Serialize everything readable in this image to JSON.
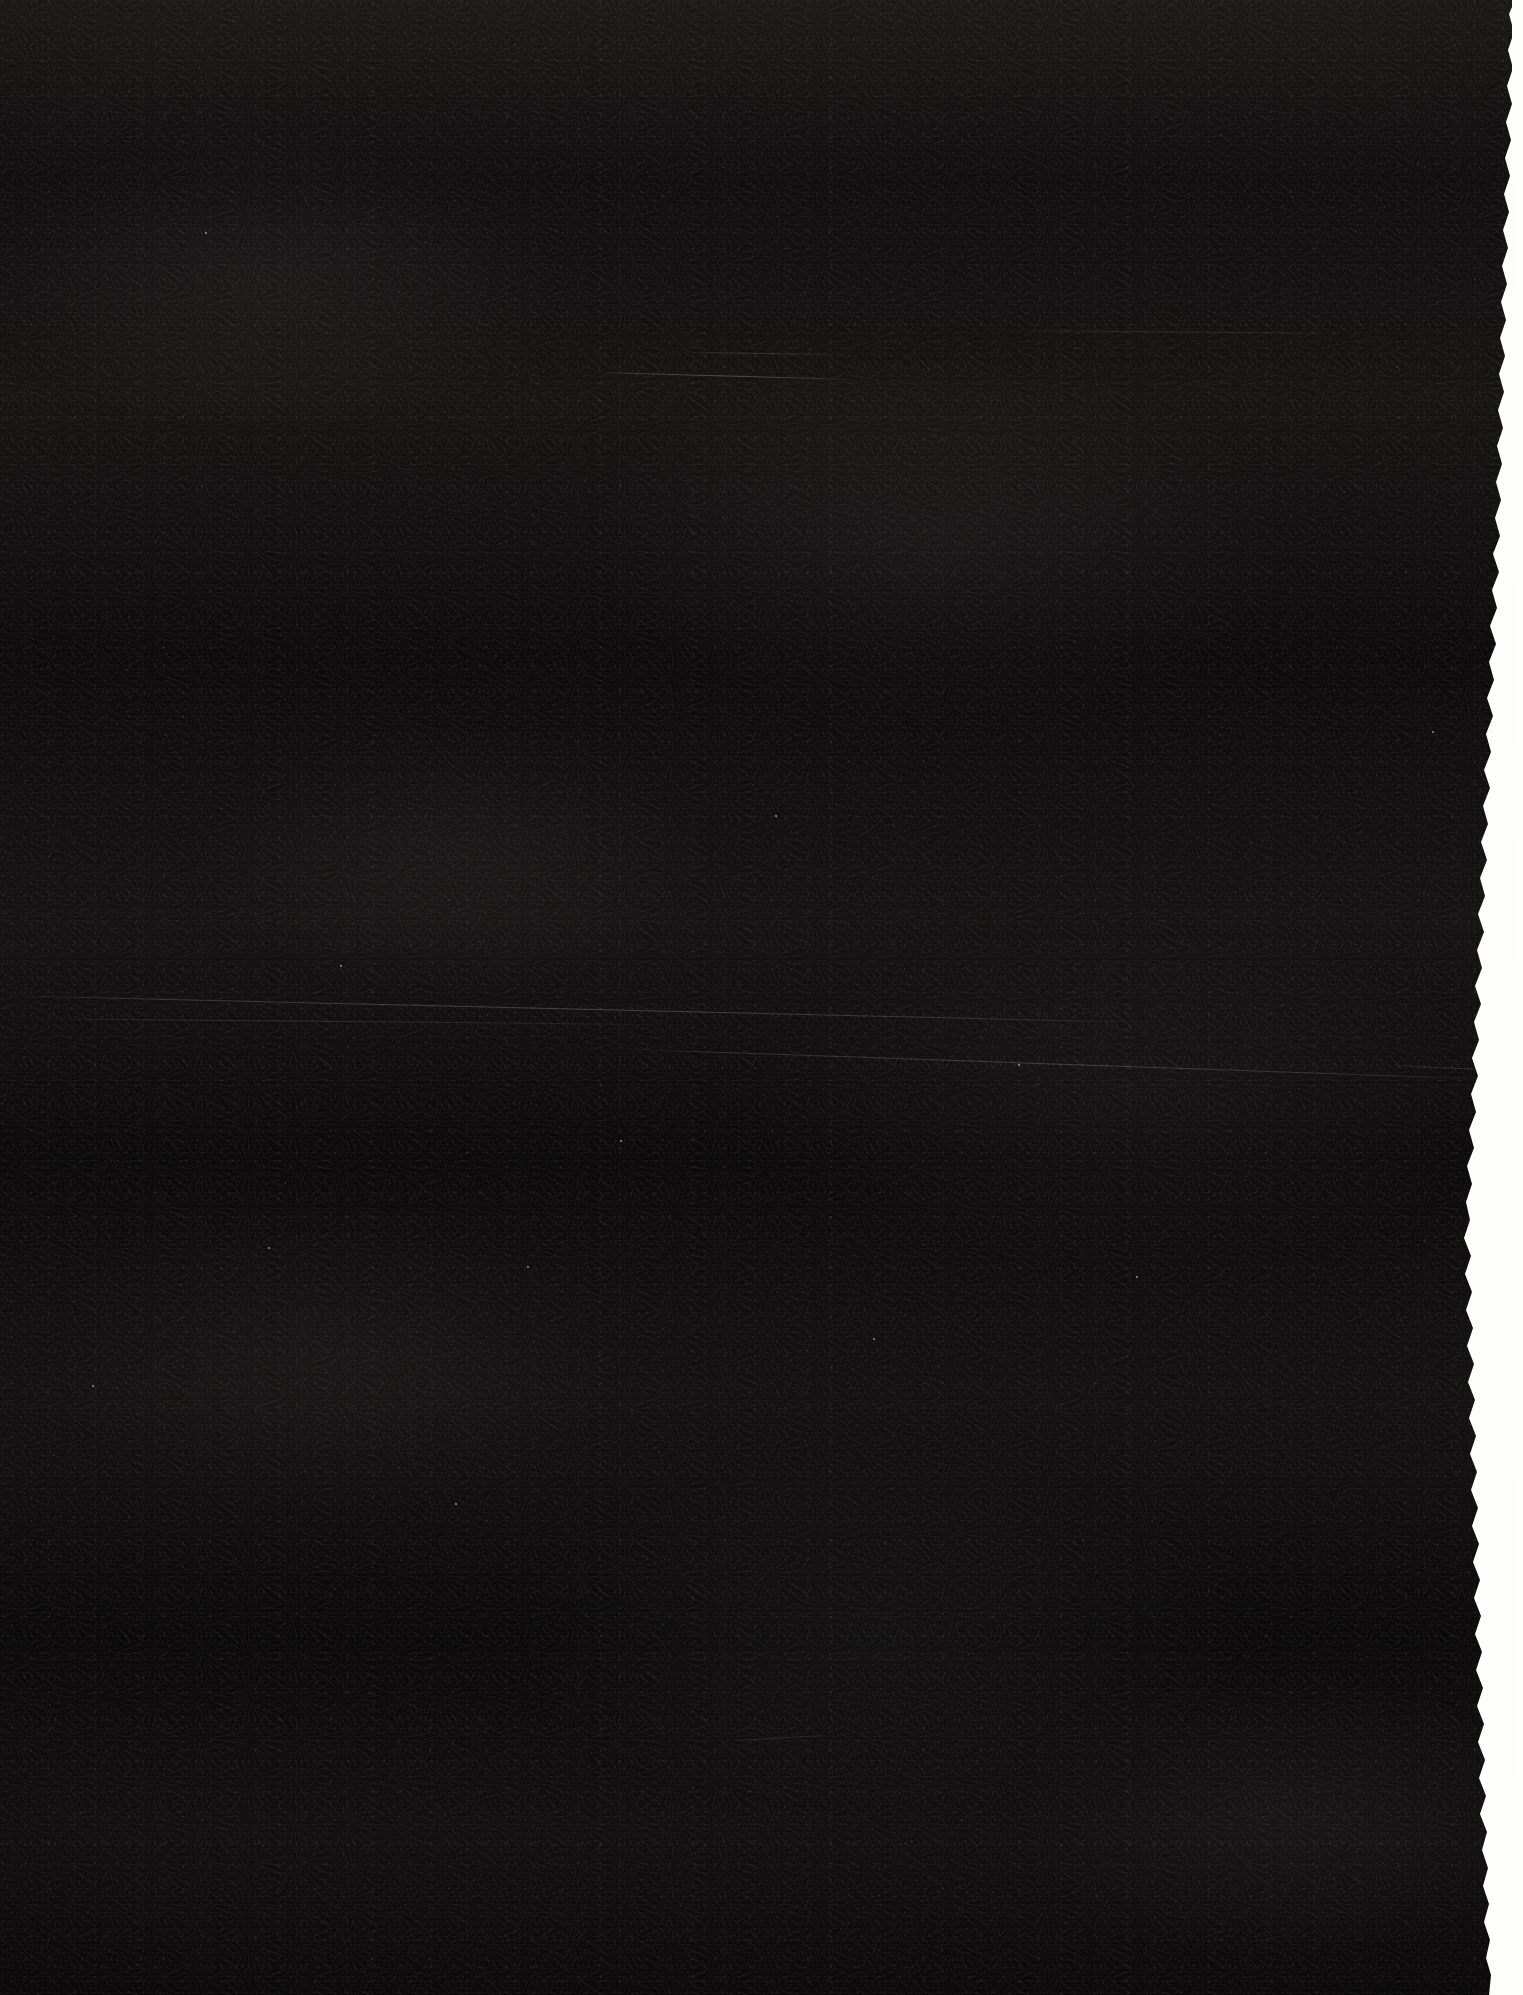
{
  "document": {
    "kind": "scanned-page",
    "condition": "severely-underexposed",
    "visible_text": "",
    "notes_label": "",
    "page_width": 1523,
    "page_height": 1995
  },
  "appearance": {
    "page_color": "#070607",
    "backdrop_color": "#fdfdfb",
    "edge_highlight_color": "#fffcf5",
    "vignette_color": "#000000"
  },
  "artifacts": {
    "torn_edge_side": "right",
    "scan_banding": "horizontal",
    "grain": "fine-mottled",
    "scratches": [
      {
        "name": "scratch-upper-short",
        "x": 600,
        "y": 372,
        "length": 255,
        "angle": 1.6
      },
      {
        "name": "scratch-upper-faint",
        "x": 690,
        "y": 352,
        "length": 150,
        "angle": 0.8
      },
      {
        "name": "scratch-mid-long",
        "x": 0,
        "y": 995,
        "length": 1180,
        "angle": 1.35
      },
      {
        "name": "scratch-mid-right",
        "x": 610,
        "y": 1048,
        "length": 910,
        "angle": 2.0
      },
      {
        "name": "scratch-mid-left",
        "x": 30,
        "y": 1018,
        "length": 640,
        "angle": 0.55
      },
      {
        "name": "scratch-upper-right",
        "x": 1005,
        "y": 330,
        "length": 330,
        "angle": 0.5
      },
      {
        "name": "scratch-lower-tick",
        "x": 735,
        "y": 1740,
        "length": 95,
        "angle": -3.2
      },
      {
        "name": "scratch-edge-right",
        "x": 1390,
        "y": 1065,
        "length": 130,
        "angle": 2.4
      }
    ],
    "specks": [
      {
        "x": 205,
        "y": 232
      },
      {
        "x": 340,
        "y": 965
      },
      {
        "x": 620,
        "y": 1140
      },
      {
        "x": 775,
        "y": 815
      },
      {
        "x": 1018,
        "y": 1064
      },
      {
        "x": 268,
        "y": 1247
      },
      {
        "x": 873,
        "y": 1338
      },
      {
        "x": 1136,
        "y": 1276
      },
      {
        "x": 527,
        "y": 1266
      },
      {
        "x": 92,
        "y": 1385
      },
      {
        "x": 1432,
        "y": 731
      },
      {
        "x": 455,
        "y": 1503
      }
    ]
  }
}
